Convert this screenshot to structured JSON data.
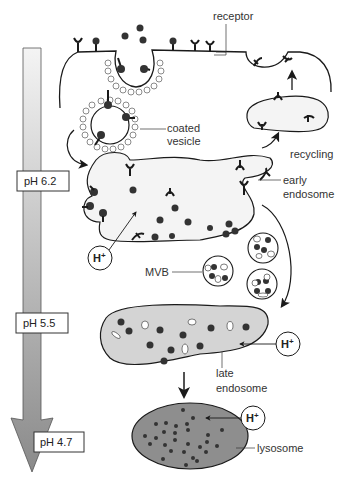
{
  "diagram": {
    "labels": {
      "receptor": "receptor",
      "coated_vesicle_1": "coated",
      "coated_vesicle_2": "vesicle",
      "recycling": "recycling",
      "early_endosome_1": "early",
      "early_endosome_2": "endosome",
      "mvb": "MVB",
      "late_endosome_1": "late",
      "late_endosome_2": "endosome",
      "lysosome": "lysosome"
    },
    "proton_label": "H",
    "proton_sup": "+",
    "ph_scale": [
      {
        "label": "pH 6.2"
      },
      {
        "label": "pH 5.5"
      },
      {
        "label": "pH 4.7"
      }
    ],
    "colors": {
      "stroke": "#1a1a1a",
      "early_endosome_fill": "#f4f4f4",
      "late_endosome_fill": "#d4d4d4",
      "lysosome_fill": "#8e8e8e",
      "coat": "#8a8a8a",
      "arrow_top": "#f2f2f2",
      "arrow_bottom": "#8c8c8c"
    }
  }
}
